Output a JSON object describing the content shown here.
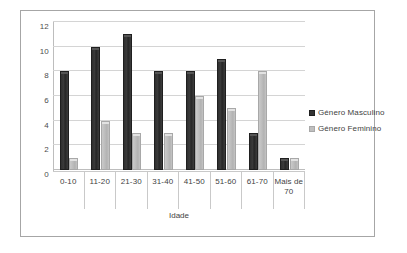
{
  "chart_data": {
    "type": "bar",
    "title": "",
    "xlabel": "Idade",
    "ylabel": "",
    "categories": [
      "0-10",
      "11-20",
      "21-30",
      "31-40",
      "41-50",
      "51-60",
      "61-70",
      "Mais de 70"
    ],
    "series": [
      {
        "name": "Género Masculino",
        "color": "#333333",
        "values": [
          8,
          10,
          11,
          8,
          8,
          9,
          3,
          1
        ]
      },
      {
        "name": "Género Feminino",
        "color": "#bfbfbf",
        "values": [
          1,
          4,
          3,
          3,
          6,
          5,
          8,
          1
        ]
      }
    ],
    "ylim": [
      0,
      12
    ],
    "yticks": [
      "0",
      "2",
      "4",
      "6",
      "8",
      "10",
      "12"
    ],
    "ytick_values": [
      0,
      2,
      4,
      6,
      8,
      10,
      12
    ],
    "grid": true,
    "legend_position": "right"
  },
  "legend": {
    "items": [
      {
        "label": "Género Masculino"
      },
      {
        "label": "Género Feminino"
      }
    ]
  },
  "axis": {
    "x_title": "Idade"
  }
}
